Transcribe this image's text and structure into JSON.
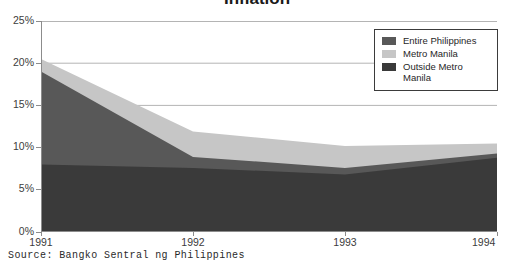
{
  "chart_data": {
    "type": "area",
    "stacked": true,
    "title": "Inflation",
    "xlabel": "",
    "ylabel": "",
    "x": [
      "1991",
      "1992",
      "1993",
      "1994"
    ],
    "categories": [
      "1991",
      "1992",
      "1993",
      "1994"
    ],
    "xlim": [
      "1991",
      "1994"
    ],
    "ylim": [
      0,
      25
    ],
    "yticks": [
      "0%",
      "5%",
      "10%",
      "15%",
      "20%",
      "25%"
    ],
    "ytick_values": [
      0,
      5,
      10,
      15,
      20,
      25
    ],
    "ytick_suffix": "%",
    "grid": true,
    "grid_axis": "y",
    "legend_position": "top-right",
    "series": [
      {
        "name": "Outside Metro Manila",
        "color": "#3a3a3a",
        "stack_order": 1,
        "values": [
          8.0,
          7.6,
          6.8,
          8.8
        ]
      },
      {
        "name": "Entire Philippines",
        "color": "#585858",
        "stack_order": 2,
        "values": [
          19.0,
          8.9,
          7.6,
          9.3
        ]
      },
      {
        "name": "Metro Manila",
        "color": "#c6c6c6",
        "stack_order": 3,
        "values": [
          20.5,
          11.9,
          10.2,
          10.5
        ]
      }
    ],
    "source": "Source: Bangko Sentral ng Philippines"
  },
  "legend": {
    "items": [
      {
        "label": "Entire Philippines",
        "color": "#585858"
      },
      {
        "label": "Metro Manila",
        "color": "#c6c6c6"
      },
      {
        "label": "Outside Metro\nManila",
        "color": "#3a3a3a"
      }
    ]
  },
  "axes": {
    "y_labels": [
      "25%",
      "20%",
      "15%",
      "10%",
      "5%",
      "0%"
    ],
    "x_labels": [
      "1991",
      "1992",
      "1993",
      "1994"
    ]
  },
  "colors": {
    "entire_philippines": "#585858",
    "metro_manila": "#c6c6c6",
    "outside_metro_manila": "#3a3a3a",
    "grid": "#b4b4b4",
    "axis": "#8c8c8c",
    "text": "#3c3c3c",
    "background": "#ffffff"
  },
  "source_note": "Source: Bangko Sentral ng Philippines",
  "title": "Inflation"
}
